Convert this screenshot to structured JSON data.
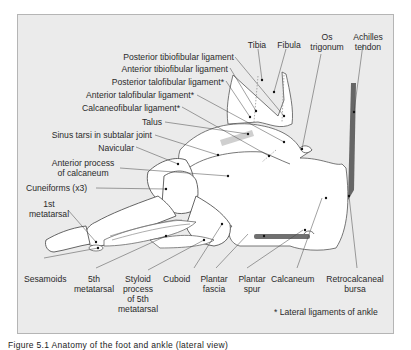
{
  "figure": {
    "labels": {
      "tibia": "Tibia",
      "fibula": "Fibula",
      "os_trigonum_1": "Os",
      "os_trigonum_2": "trigonum",
      "achilles_1": "Achilles",
      "achilles_2": "tendon",
      "post_tibiofibular": "Posterior tibiofibular ligament",
      "ant_tibiofibular": "Anterior tibiofibular ligament",
      "post_talofibular": "Posterior talofibular ligament*",
      "ant_talofibular": "Anterior talofibular ligament*",
      "calcaneofibular": "Calcaneofibular ligament*",
      "talus": "Talus",
      "sinus_tarsi": "Sinus tarsi in subtalar joint",
      "navicular": "Navicular",
      "ant_process_1": "Anterior process",
      "ant_process_2": "of calcaneum",
      "cuneiforms": "Cuneiforms (x3)",
      "first_mt_1": "1st",
      "first_mt_2": "metatarsal",
      "sesamoids": "Sesamoids",
      "fifth_mt_1": "5th",
      "fifth_mt_2": "metatarsal",
      "styloid_1": "Styloid",
      "styloid_2": "process",
      "styloid_3": "of 5th",
      "styloid_4": "metatarsal",
      "cuboid": "Cuboid",
      "plantar_fascia_1": "Plantar",
      "plantar_fascia_2": "fascia",
      "plantar_spur_1": "Plantar",
      "plantar_spur_2": "spur",
      "calcaneum": "Calcaneum",
      "retrocalcaneal_1": "Retrocalcaneal",
      "retrocalcaneal_2": "bursa",
      "footnote": "* Lateral ligaments of ankle"
    },
    "caption": "Figure 5.1  Anatomy of the foot and ankle (lateral view)"
  },
  "colors": {
    "frame_bg": "#ebebeb",
    "frame_border": "#b5b5b5",
    "bone_fill": "#ffffff",
    "outline": "#555555",
    "tendon": "#6e6e6e",
    "ligament": "#c8c8c8"
  }
}
